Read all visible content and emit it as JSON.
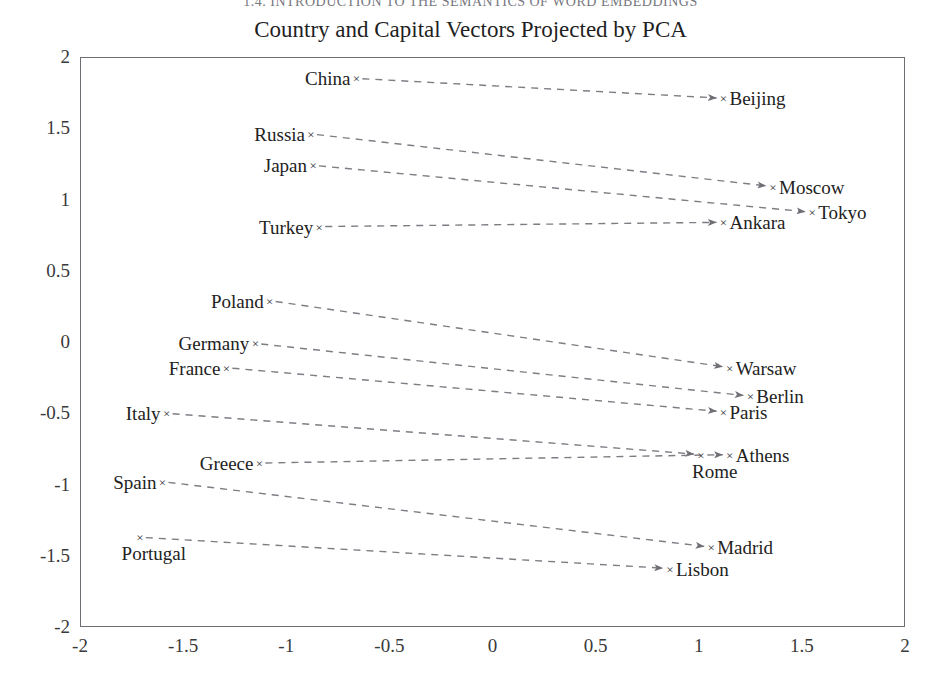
{
  "page": {
    "running_header": "1.4. INTRODUCTION TO THE SEMANTICS OF WORD EMBEDDINGS"
  },
  "chart_data": {
    "type": "scatter",
    "title": "Country and Capital Vectors Projected by PCA",
    "xlabel": "",
    "ylabel": "",
    "xlim": [
      -2,
      2
    ],
    "ylim": [
      -2,
      2
    ],
    "xticks": [
      "-2",
      "-1.5",
      "-1",
      "-0.5",
      "0",
      "0.5",
      "1",
      "1.5",
      "2"
    ],
    "xtick_values": [
      -2,
      -1.5,
      -1,
      -0.5,
      0,
      0.5,
      1,
      1.5,
      2
    ],
    "yticks": [
      "2",
      "1.5",
      "1",
      "0.5",
      "0",
      "-0.5",
      "-1",
      "-1.5",
      "-2"
    ],
    "ytick_values": [
      2,
      1.5,
      1,
      0.5,
      0,
      -0.5,
      -1,
      -1.5,
      -2
    ],
    "grid": false,
    "legend": null,
    "marker": "x",
    "line_style": "dashed",
    "line_color": "#7d7d84",
    "marker_color": "#35353b",
    "pairs": [
      {
        "country": "China",
        "country_xy": [
          -0.66,
          1.85
        ],
        "country_label_side": "left",
        "capital": "Beijing",
        "capital_xy": [
          1.12,
          1.71
        ],
        "capital_label_side": "right"
      },
      {
        "country": "Russia",
        "country_xy": [
          -0.88,
          1.46
        ],
        "country_label_side": "left",
        "capital": "Moscow",
        "capital_xy": [
          1.36,
          1.09
        ],
        "capital_label_side": "right"
      },
      {
        "country": "Japan",
        "country_xy": [
          -0.87,
          1.24
        ],
        "country_label_side": "left",
        "capital": "Tokyo",
        "capital_xy": [
          1.55,
          0.91
        ],
        "capital_label_side": "right"
      },
      {
        "country": "Turkey",
        "country_xy": [
          -0.84,
          0.81
        ],
        "country_label_side": "left",
        "capital": "Ankara",
        "capital_xy": [
          1.12,
          0.84
        ],
        "capital_label_side": "right"
      },
      {
        "country": "Poland",
        "country_xy": [
          -1.08,
          0.29
        ],
        "country_label_side": "left",
        "capital": "Warsaw",
        "capital_xy": [
          1.15,
          -0.18
        ],
        "capital_label_side": "right"
      },
      {
        "country": "Germany",
        "country_xy": [
          -1.15,
          -0.01
        ],
        "country_label_side": "left",
        "capital": "Berlin",
        "capital_xy": [
          1.25,
          -0.38
        ],
        "capital_label_side": "right"
      },
      {
        "country": "France",
        "country_xy": [
          -1.29,
          -0.18
        ],
        "country_label_side": "left",
        "capital": "Paris",
        "capital_xy": [
          1.12,
          -0.49
        ],
        "capital_label_side": "right"
      },
      {
        "country": "Italy",
        "country_xy": [
          -1.58,
          -0.5
        ],
        "country_label_side": "left",
        "capital": "Rome",
        "capital_xy": [
          1.01,
          -0.79
        ],
        "capital_label_side": "below"
      },
      {
        "country": "Greece",
        "country_xy": [
          -1.13,
          -0.85
        ],
        "country_label_side": "left",
        "capital": "Athens",
        "capital_xy": [
          1.15,
          -0.79
        ],
        "capital_label_side": "right"
      },
      {
        "country": "Spain",
        "country_xy": [
          -1.6,
          -0.98
        ],
        "country_label_side": "left",
        "capital": "Madrid",
        "capital_xy": [
          1.06,
          -1.44
        ],
        "capital_label_side": "right"
      },
      {
        "country": "Portugal",
        "country_xy": [
          -1.71,
          -1.37
        ],
        "country_label_side": "below",
        "capital": "Lisbon",
        "capital_xy": [
          0.86,
          -1.59
        ],
        "capital_label_side": "right"
      }
    ]
  }
}
